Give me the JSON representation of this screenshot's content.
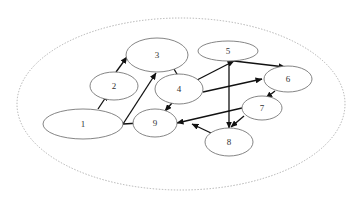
{
  "diagram": {
    "type": "directed-graph",
    "container": {
      "cx": 181,
      "cy": 104,
      "rx": 164,
      "ry": 86,
      "style": "dotted",
      "color": "#a8a8a8"
    },
    "nodes": [
      {
        "id": "1",
        "label": "1",
        "cx": 83,
        "cy": 124,
        "rx": 40,
        "ry": 15
      },
      {
        "id": "2",
        "label": "2",
        "cx": 114,
        "cy": 86,
        "rx": 24,
        "ry": 14
      },
      {
        "id": "3",
        "label": "3",
        "cx": 157,
        "cy": 55,
        "rx": 31,
        "ry": 17
      },
      {
        "id": "4",
        "label": "4",
        "cx": 179,
        "cy": 89,
        "rx": 24,
        "ry": 15
      },
      {
        "id": "5",
        "label": "5",
        "cx": 228,
        "cy": 51,
        "rx": 30,
        "ry": 10
      },
      {
        "id": "6",
        "label": "6",
        "cx": 288,
        "cy": 79,
        "rx": 24,
        "ry": 13
      },
      {
        "id": "7",
        "label": "7",
        "cx": 262,
        "cy": 108,
        "rx": 20,
        "ry": 12
      },
      {
        "id": "8",
        "label": "8",
        "cx": 229,
        "cy": 142,
        "rx": 24,
        "ry": 14
      },
      {
        "id": "9",
        "label": "9",
        "cx": 155,
        "cy": 123,
        "rx": 22,
        "ry": 14
      }
    ],
    "edges": [
      {
        "from": "1",
        "to": "2",
        "x1": 98,
        "y1": 109,
        "x2": 108,
        "y2": 94
      },
      {
        "from": "1",
        "to": "3",
        "x1": 123,
        "y1": 124,
        "x2": 156,
        "y2": 73
      },
      {
        "from": "1",
        "to": "9",
        "x1": 123,
        "y1": 124,
        "x2": 140,
        "y2": 123
      },
      {
        "from": "2",
        "to": "3",
        "x1": 116,
        "y1": 72,
        "x2": 127,
        "y2": 57
      },
      {
        "from": "3",
        "to": "4",
        "x1": 174,
        "y1": 69,
        "x2": 181,
        "y2": 81
      },
      {
        "from": "4",
        "to": "5",
        "x1": 197,
        "y1": 80,
        "x2": 234,
        "y2": 61
      },
      {
        "from": "4",
        "to": "6",
        "x1": 203,
        "y1": 92,
        "x2": 262,
        "y2": 79
      },
      {
        "from": "4",
        "to": "9",
        "x1": 172,
        "y1": 103,
        "x2": 165,
        "y2": 111
      },
      {
        "from": "5",
        "to": "6",
        "x1": 234,
        "y1": 61,
        "x2": 285,
        "y2": 67
      },
      {
        "from": "5",
        "to": "8",
        "x1": 229,
        "y1": 61,
        "x2": 229,
        "y2": 128
      },
      {
        "from": "6",
        "to": "7",
        "x1": 275,
        "y1": 91,
        "x2": 266,
        "y2": 98
      },
      {
        "from": "7",
        "to": "8",
        "x1": 244,
        "y1": 116,
        "x2": 231,
        "y2": 127
      },
      {
        "from": "7",
        "to": "9",
        "x1": 242,
        "y1": 108,
        "x2": 177,
        "y2": 123
      },
      {
        "from": "8",
        "to": "9",
        "x1": 211,
        "y1": 133,
        "x2": 192,
        "y2": 124
      }
    ],
    "edge_color": "#111111",
    "node_stroke": "#777777"
  }
}
